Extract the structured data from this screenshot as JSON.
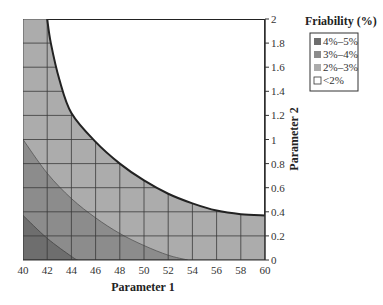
{
  "chart_data": {
    "type": "contour",
    "title": "",
    "xlabel": "Parameter 1",
    "ylabel": "Parameter 2",
    "xlim": [
      40,
      60
    ],
    "ylim": [
      0,
      2
    ],
    "x_ticks": [
      40,
      42,
      44,
      46,
      48,
      50,
      52,
      54,
      56,
      58,
      60
    ],
    "y_ticks": [
      0,
      0.2,
      0.4,
      0.6,
      0.8,
      1,
      1.2,
      1.4,
      1.6,
      1.8,
      2
    ],
    "y_axis_position": "right",
    "grid": true,
    "legend": {
      "title": "Friability (%)",
      "position": "right",
      "entries": [
        {
          "label": "4%–5%",
          "color": "#6e6e6e"
        },
        {
          "label": "3%–4%",
          "color": "#8c8c8c"
        },
        {
          "label": "2%–3%",
          "color": "#acacac"
        },
        {
          "label": "<2%",
          "color": "#ffffff"
        }
      ]
    },
    "regions": [
      {
        "name": "2%–3%",
        "color": "#acacac",
        "fills": "entire plot background below the <2% boundary"
      },
      {
        "name": "<2%",
        "color": "#ffffff",
        "boundary": [
          [
            42,
            2
          ],
          [
            42.3,
            1.8
          ],
          [
            43,
            1.5
          ],
          [
            44,
            1.22
          ],
          [
            46,
            0.98
          ],
          [
            48,
            0.8
          ],
          [
            50,
            0.66
          ],
          [
            52,
            0.55
          ],
          [
            54,
            0.47
          ],
          [
            56,
            0.41
          ],
          [
            58,
            0.38
          ],
          [
            60,
            0.37
          ]
        ]
      },
      {
        "name": "3%–4%",
        "color": "#8c8c8c",
        "boundary": [
          [
            40,
            1.0
          ],
          [
            42,
            0.72
          ],
          [
            44,
            0.51
          ],
          [
            46,
            0.35
          ],
          [
            48,
            0.22
          ],
          [
            50,
            0.12
          ],
          [
            52,
            0.04
          ],
          [
            53.6,
            0
          ]
        ]
      },
      {
        "name": "4%–5%",
        "color": "#6e6e6e",
        "boundary": [
          [
            40,
            0.37
          ],
          [
            42,
            0.18
          ],
          [
            44,
            0.03
          ],
          [
            44.5,
            0
          ]
        ]
      }
    ]
  },
  "labels": {
    "xlabel": "Parameter 1",
    "ylabel": "Parameter 2",
    "legend_title": "Friability (%)",
    "legend_items": [
      "4%–5%",
      "3%–4%",
      "2%–3%",
      "<2%"
    ],
    "x_ticks": [
      "40",
      "42",
      "44",
      "46",
      "48",
      "50",
      "52",
      "54",
      "56",
      "58",
      "60"
    ],
    "y_ticks": [
      "0",
      "0.2",
      "0.4",
      "0.6",
      "0.8",
      "1",
      "1.2",
      "1.4",
      "1.6",
      "1.8",
      "2"
    ]
  }
}
